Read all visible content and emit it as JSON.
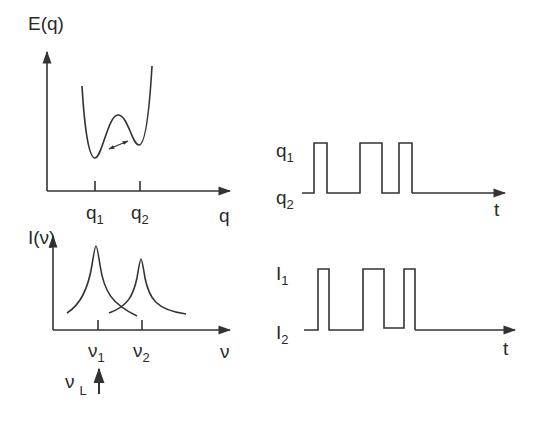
{
  "panels": {
    "potential": {
      "y_axis_label": "E(q)",
      "x_axis_label": "q",
      "ticks": [
        {
          "base": "q",
          "sub": "1"
        },
        {
          "base": "q",
          "sub": "2"
        }
      ],
      "annotation": "double-arrow between wells"
    },
    "spectrum": {
      "y_axis_label": "I(ν)",
      "x_axis_label": "ν",
      "ticks": [
        {
          "base": "ν",
          "sub": "1"
        },
        {
          "base": "ν",
          "sub": "2"
        }
      ],
      "laser": {
        "base": "ν",
        "sub": "L"
      }
    },
    "q_trace": {
      "high_label": {
        "base": "q",
        "sub": "1"
      },
      "low_label": {
        "base": "q",
        "sub": "2"
      },
      "time_label": "t"
    },
    "i_trace": {
      "high_label": {
        "base": "I",
        "sub": "1"
      },
      "low_label": {
        "base": "I",
        "sub": "2"
      },
      "time_label": "t"
    }
  },
  "colors": {
    "line": "#333333",
    "background": "#ffffff"
  }
}
